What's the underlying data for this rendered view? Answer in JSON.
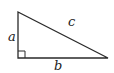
{
  "diagram": {
    "type": "right-triangle",
    "labels": {
      "a": "a",
      "b": "b",
      "c": "c"
    },
    "vertices": {
      "top": [
        18,
        12
      ],
      "right_angle": [
        18,
        58
      ],
      "right": [
        108,
        58
      ]
    },
    "right_angle_marker": true,
    "stroke_color": "#2a2a2a"
  }
}
